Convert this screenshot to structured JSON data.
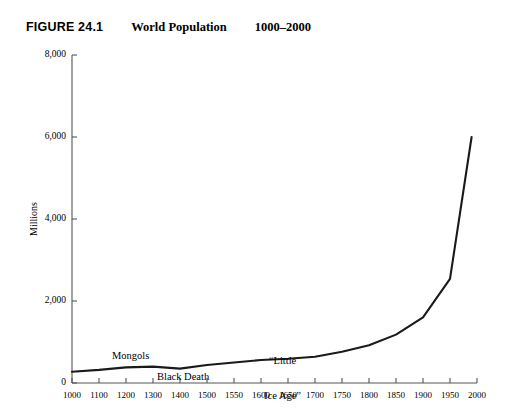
{
  "header": {
    "figure_number": "FIGURE 24.1",
    "title": "World Population",
    "date_range": "1000–2000"
  },
  "chart_data": {
    "type": "line",
    "title": "World Population",
    "subtitle": "1000–2000",
    "xlabel": "",
    "ylabel": "Millions",
    "ylim": [
      0,
      8000
    ],
    "yticks": [
      0,
      2000,
      4000,
      6000,
      8000
    ],
    "ytick_labels": [
      "0",
      "2,000",
      "4,000",
      "6,000",
      "8,000"
    ],
    "xticks": [
      1000,
      1100,
      1200,
      1300,
      1400,
      1500,
      1550,
      1600,
      1650,
      1700,
      1750,
      1800,
      1850,
      1900,
      1950,
      2000
    ],
    "xtick_labels": [
      "1000",
      "1100",
      "1200",
      "1300",
      "1400",
      "1500",
      "1550",
      "1600",
      "1650",
      "1700",
      "1750",
      "1800",
      "1850",
      "1900",
      "1950",
      "2000"
    ],
    "x_axis_note": "tick positions are evenly spaced although the year intervals change from 100 years to 50 years after 1500",
    "grid": false,
    "legend": null,
    "series": [
      {
        "name": "World population",
        "x": [
          1000,
          1100,
          1200,
          1300,
          1400,
          1500,
          1550,
          1600,
          1650,
          1700,
          1750,
          1800,
          1850,
          1900,
          1950,
          1990
        ],
        "values": [
          275,
          320,
          380,
          400,
          350,
          440,
          500,
          560,
          590,
          640,
          760,
          920,
          1180,
          1600,
          2540,
          6000
        ]
      }
    ],
    "annotations": [
      {
        "id": "mongols",
        "text": "Mongols",
        "x": 1200,
        "y": 760
      },
      {
        "id": "black-death",
        "text": "Black Death",
        "x": 1330,
        "y": 260
      },
      {
        "id": "little-ice-age",
        "text": "“Little\nIce Age”",
        "x": 1615,
        "y": 1200
      }
    ]
  },
  "annotations_text": {
    "mongols": "Mongols",
    "black_death": "Black Death",
    "little_ice_age_line1": "“Little",
    "little_ice_age_line2": "Ice Age”"
  },
  "colors": {
    "background": "#ffffff",
    "line": "#1a1a1a",
    "axis": "#555555",
    "text": "#000000"
  }
}
